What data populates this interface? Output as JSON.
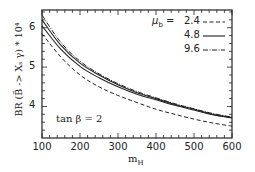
{
  "chart_data": {
    "type": "line",
    "title": "",
    "xlabel": "m_H",
    "ylabel": "BR (B̄ -> X_s γ) * 10⁴",
    "xlim": [
      100,
      600
    ],
    "ylim": [
      3.2,
      6.45
    ],
    "xticks": [
      100,
      200,
      300,
      400,
      500,
      600
    ],
    "yticks": [
      4,
      5,
      6
    ],
    "grid": false,
    "legend_position": "upper right",
    "legend_title": "μ_b =",
    "annotation": "tan β = 2",
    "x": [
      100,
      150,
      200,
      250,
      300,
      350,
      400,
      450,
      500,
      550,
      600
    ],
    "series": [
      {
        "name": "2.4",
        "style": "dashed",
        "values": [
          5.85,
          5.25,
          4.8,
          4.5,
          4.28,
          4.1,
          3.93,
          3.8,
          3.68,
          3.58,
          3.5
        ]
      },
      {
        "name": "4.8",
        "style": "solid",
        "values": [
          6.2,
          5.55,
          5.1,
          4.8,
          4.55,
          4.35,
          4.2,
          4.05,
          3.93,
          3.8,
          3.72
        ]
      },
      {
        "name": "9.6",
        "style": "dash-dot",
        "values": [
          6.32,
          5.62,
          5.15,
          4.83,
          4.58,
          4.38,
          4.22,
          4.07,
          3.94,
          3.82,
          3.73
        ]
      },
      {
        "name": "4.8 (lower solid)",
        "style": "solid",
        "values": [
          6.05,
          5.45,
          5.02,
          4.73,
          4.5,
          4.31,
          4.17,
          4.03,
          3.91,
          3.79,
          3.71
        ]
      }
    ]
  },
  "labels": {
    "ylabel": "BR (B̄ -> Xₛ γ) * 10⁴",
    "xlabel": "m",
    "xlabel_sub": "H",
    "annotation": "tan β = 2",
    "legend_title": "μ",
    "legend_title_sub": "b",
    "legend_eq": "=",
    "legend_items": [
      "2.4",
      "4.8",
      "9.6"
    ],
    "xticks": [
      "100",
      "200",
      "300",
      "400",
      "500",
      "600"
    ],
    "yticks": [
      "6",
      "5",
      "4"
    ]
  }
}
